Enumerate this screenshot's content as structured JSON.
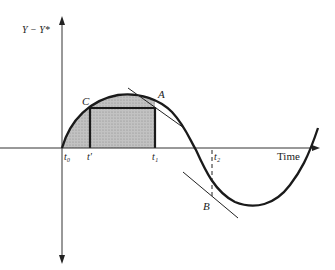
{
  "diagram": {
    "y_axis_label": "Y − Y*",
    "x_axis_label": "Time",
    "points": {
      "A": "A",
      "B": "B",
      "C": "C"
    },
    "ticks": {
      "t0": "t₀",
      "t_prime": "t′",
      "t1": "t₁",
      "t2": "t₂"
    },
    "colors": {
      "stroke": "#1a1a1a",
      "shaded_area": "#b9b9b9",
      "axis": "#333333"
    }
  }
}
